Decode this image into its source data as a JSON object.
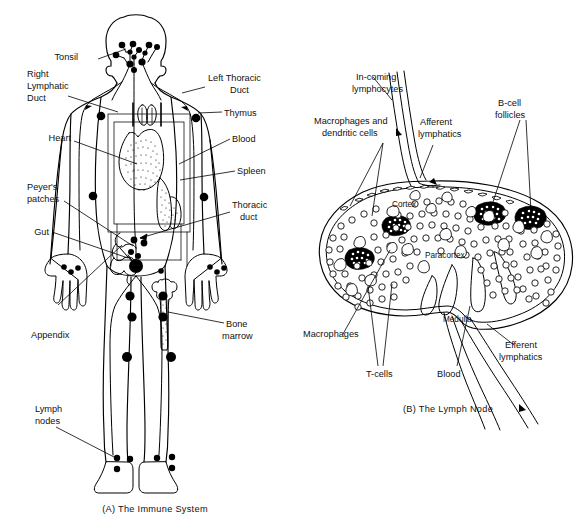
{
  "figure": {
    "panels": [
      {
        "id": "A",
        "caption": "(A)  The Immune System",
        "labels": [
          {
            "key": "tonsil",
            "text": "Tonsil"
          },
          {
            "key": "right_lymphatic_duct_l1",
            "text": "Right"
          },
          {
            "key": "right_lymphatic_duct_l2",
            "text": "Lymphatic"
          },
          {
            "key": "right_lymphatic_duct_l3",
            "text": "Duct"
          },
          {
            "key": "heart",
            "text": "Heart"
          },
          {
            "key": "peyers_patches_l1",
            "text": "Peyer's"
          },
          {
            "key": "peyers_patches_l2",
            "text": "patches"
          },
          {
            "key": "gut",
            "text": "Gut"
          },
          {
            "key": "appendix",
            "text": "Appendix"
          },
          {
            "key": "lymph_nodes_l1",
            "text": "Lymph"
          },
          {
            "key": "lymph_nodes_l2",
            "text": "nodes"
          },
          {
            "key": "left_thoracic_duct_l1",
            "text": "Left Thoracic"
          },
          {
            "key": "left_thoracic_duct_l2",
            "text": "Duct"
          },
          {
            "key": "thymus",
            "text": "Thymus"
          },
          {
            "key": "blood",
            "text": "Blood"
          },
          {
            "key": "spleen",
            "text": "Spleen"
          },
          {
            "key": "thoracic_duct_l1",
            "text": "Thoracic"
          },
          {
            "key": "thoracic_duct_l2",
            "text": "duct"
          },
          {
            "key": "bone_marrow_l1",
            "text": "Bone"
          },
          {
            "key": "bone_marrow_l2",
            "text": "marrow"
          }
        ]
      },
      {
        "id": "B",
        "caption": "(B)  The Lymph Node",
        "labels": [
          {
            "key": "incoming_lymphocytes_l1",
            "text": "In-coming"
          },
          {
            "key": "incoming_lymphocytes_l2",
            "text": "lymphocytes"
          },
          {
            "key": "macrophages_dendritic_l1",
            "text": "Macrophages and"
          },
          {
            "key": "macrophages_dendritic_l2",
            "text": "dendritic cells"
          },
          {
            "key": "afferent_lymphatics_l1",
            "text": "Afferent"
          },
          {
            "key": "afferent_lymphatics_l2",
            "text": "lymphatics"
          },
          {
            "key": "bcell_follicles_l1",
            "text": "B-cell"
          },
          {
            "key": "bcell_follicles_l2",
            "text": "follicles"
          },
          {
            "key": "cortex",
            "text": "Cortex"
          },
          {
            "key": "paracortex",
            "text": "Paracortex"
          },
          {
            "key": "macrophages",
            "text": "Macrophages"
          },
          {
            "key": "tcells",
            "text": "T-cells"
          },
          {
            "key": "medulla",
            "text": "Medulla"
          },
          {
            "key": "blood",
            "text": "Blood"
          },
          {
            "key": "efferent_lymphatics_l1",
            "text": "Efferent"
          },
          {
            "key": "efferent_lymphatics_l2",
            "text": "lymphatics"
          }
        ]
      }
    ]
  },
  "panel_a": {
    "caption": "(A)  The Immune System",
    "tonsil": "Tonsil",
    "right_duct_1": "Right",
    "right_duct_2": "Lymphatic",
    "right_duct_3": "Duct",
    "heart": "Heart",
    "peyers_1": "Peyer's",
    "peyers_2": "patches",
    "gut": "Gut",
    "appendix": "Appendix",
    "lymph_nodes_1": "Lymph",
    "lymph_nodes_2": "nodes",
    "left_duct_1": "Left Thoracic",
    "left_duct_2": "Duct",
    "thymus": "Thymus",
    "blood": "Blood",
    "spleen": "Spleen",
    "thoracic_1": "Thoracic",
    "thoracic_2": "duct",
    "bone_1": "Bone",
    "bone_2": "marrow"
  },
  "panel_b": {
    "caption": "(B)  The Lymph Node",
    "incoming_1": "In-coming",
    "incoming_2": "lymphocytes",
    "macro_dend_1": "Macrophages and",
    "macro_dend_2": "dendritic cells",
    "afferent_1": "Afferent",
    "afferent_2": "lymphatics",
    "bcell_1": "B-cell",
    "bcell_2": "follicles",
    "cortex": "Cortex",
    "paracortex": "Paracortex",
    "macrophages": "Macrophages",
    "tcells": "T-cells",
    "medulla": "Medulla",
    "blood": "Blood",
    "efferent_1": "Efferent",
    "efferent_2": "lymphatics"
  },
  "colors": {
    "ink": "#000000",
    "paper": "#ffffff"
  }
}
